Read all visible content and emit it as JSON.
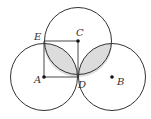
{
  "diagram": {
    "type": "geometry",
    "points": [
      {
        "name": "A",
        "x": 44,
        "y": 77,
        "dot": true,
        "label_dx": -10,
        "label_dy": 6
      },
      {
        "name": "B",
        "x": 112,
        "y": 77,
        "dot": true,
        "label_dx": 5,
        "label_dy": 7
      },
      {
        "name": "C",
        "x": 78,
        "y": 41,
        "dot": true,
        "label_dx": -2,
        "label_dy": -5
      },
      {
        "name": "D",
        "x": 78,
        "y": 77,
        "dot": false,
        "label_dx": 2,
        "label_dy": 11
      },
      {
        "name": "E",
        "x": 44,
        "y": 41,
        "dot": false,
        "label_dx": -10,
        "label_dy": -2
      }
    ],
    "radius": 33.5,
    "colors": {
      "stroke": "#333333",
      "shade": "#d9d9d9"
    }
  }
}
